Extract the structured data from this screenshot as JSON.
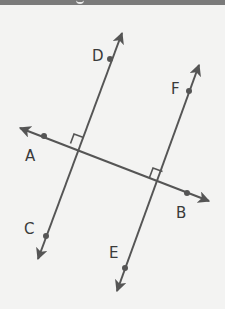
{
  "header": {
    "title_fragment": ""
  },
  "diagram": {
    "colors": {
      "background": "#f3f3f2",
      "line": "#555555",
      "label": "#3a3a3a",
      "header_bar": "#7a7a7a"
    },
    "lines": [
      {
        "name": "CD",
        "from_label": "C",
        "to_label": "D"
      },
      {
        "name": "EF",
        "from_label": "E",
        "to_label": "F"
      },
      {
        "name": "AB",
        "from_label": "A",
        "to_label": "B"
      }
    ],
    "points": {
      "A": "A",
      "B": "B",
      "C": "C",
      "D": "D",
      "E": "E",
      "F": "F"
    },
    "right_angles": [
      {
        "at": "CD ∩ AB"
      },
      {
        "at": "EF ∩ AB"
      }
    ]
  }
}
